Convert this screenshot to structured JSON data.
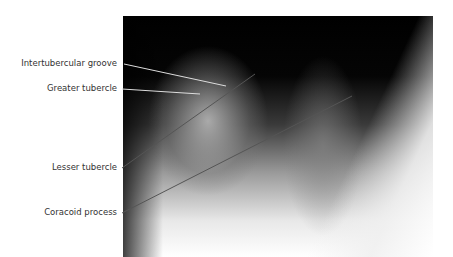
{
  "figure": {
    "type": "radiograph",
    "labels": [
      {
        "text": "Intertubercular groove",
        "y": 64,
        "line": [
          124,
          64,
          226,
          86
        ]
      },
      {
        "text": "Greater tubercle",
        "y": 89,
        "line": [
          122,
          89,
          200,
          94
        ]
      },
      {
        "text": "Lesser tubercle",
        "y": 168,
        "line": [
          122,
          168,
          255,
          74
        ]
      },
      {
        "text": "Coracoid process",
        "y": 213,
        "line": [
          122,
          213,
          352,
          96
        ]
      }
    ]
  }
}
